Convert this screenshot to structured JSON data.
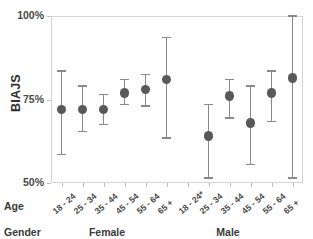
{
  "chart_data": {
    "type": "scatter",
    "title": "",
    "xlabel": "Age",
    "ylabel": "BIAJS",
    "ylim": [
      50,
      100
    ],
    "yticks": [
      50,
      75,
      100
    ],
    "ytick_labels": [
      "50%",
      "75%",
      "100%"
    ],
    "grid": false,
    "legend": null,
    "group_row_label": "Gender",
    "age_row_label": "Age",
    "groups": [
      {
        "name": "Female",
        "label": "Female"
      },
      {
        "name": "Male",
        "label": "Male"
      }
    ],
    "categories": [
      "18 - 24",
      "25 - 34",
      "35 - 44",
      "45 - 54",
      "55 - 64",
      "65 +",
      "18 - 24*",
      "25 - 34",
      "35 - 44",
      "45 - 54",
      "55 - 64",
      "65 +"
    ],
    "series": [
      {
        "name": "BIAJS mean with 95% CI",
        "points": [
          {
            "group": "Female",
            "age": "18 - 24",
            "value": 72.0,
            "low": 58.5,
            "high": 83.5
          },
          {
            "group": "Female",
            "age": "25 - 34",
            "value": 72.0,
            "low": 65.5,
            "high": 79.0
          },
          {
            "group": "Female",
            "age": "35 - 44",
            "value": 72.0,
            "low": 67.5,
            "high": 76.5
          },
          {
            "group": "Female",
            "age": "45 - 54",
            "value": 77.0,
            "low": 73.5,
            "high": 81.0
          },
          {
            "group": "Female",
            "age": "55 - 64",
            "value": 78.0,
            "low": 73.0,
            "high": 82.5
          },
          {
            "group": "Female",
            "age": "65 +",
            "value": 81.0,
            "low": 63.5,
            "high": 93.5
          },
          {
            "group": "Male",
            "age": "18 - 24*",
            "value": null,
            "low": null,
            "high": null
          },
          {
            "group": "Male",
            "age": "25 - 34",
            "value": 64.0,
            "low": 51.5,
            "high": 73.5
          },
          {
            "group": "Male",
            "age": "35 - 44",
            "value": 76.0,
            "low": 69.5,
            "high": 81.0
          },
          {
            "group": "Male",
            "age": "45 - 54",
            "value": 68.0,
            "low": 55.5,
            "high": 79.0
          },
          {
            "group": "Male",
            "age": "55 - 64",
            "value": 77.0,
            "low": 68.5,
            "high": 83.5
          },
          {
            "group": "Male",
            "age": "65 +",
            "value": 81.5,
            "low": 51.5,
            "high": 100.0
          }
        ]
      }
    ],
    "colors": {
      "marker": "#595959",
      "errorbar": "#8a8a8a",
      "frame": "#d4d4d4",
      "text": "#3a3a3a"
    }
  }
}
